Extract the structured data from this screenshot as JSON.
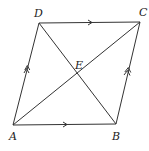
{
  "diagram": {
    "type": "parallelogram",
    "vertices": {
      "A": {
        "label": "A",
        "x": 13,
        "y": 125
      },
      "B": {
        "label": "B",
        "x": 116,
        "y": 124
      },
      "C": {
        "label": "C",
        "x": 140,
        "y": 22
      },
      "D": {
        "label": "D",
        "x": 39,
        "y": 23
      },
      "E": {
        "label": "E",
        "x": 77,
        "y": 74
      }
    },
    "edges": [
      {
        "from": "A",
        "to": "B",
        "marker": "single-arrow"
      },
      {
        "from": "D",
        "to": "C",
        "marker": "single-arrow"
      },
      {
        "from": "A",
        "to": "D",
        "marker": "double-arrow"
      },
      {
        "from": "B",
        "to": "C",
        "marker": "double-arrow"
      }
    ],
    "diagonals": [
      {
        "from": "A",
        "to": "C"
      },
      {
        "from": "D",
        "to": "B"
      }
    ],
    "intersection": "E",
    "line_color": "#333333"
  }
}
